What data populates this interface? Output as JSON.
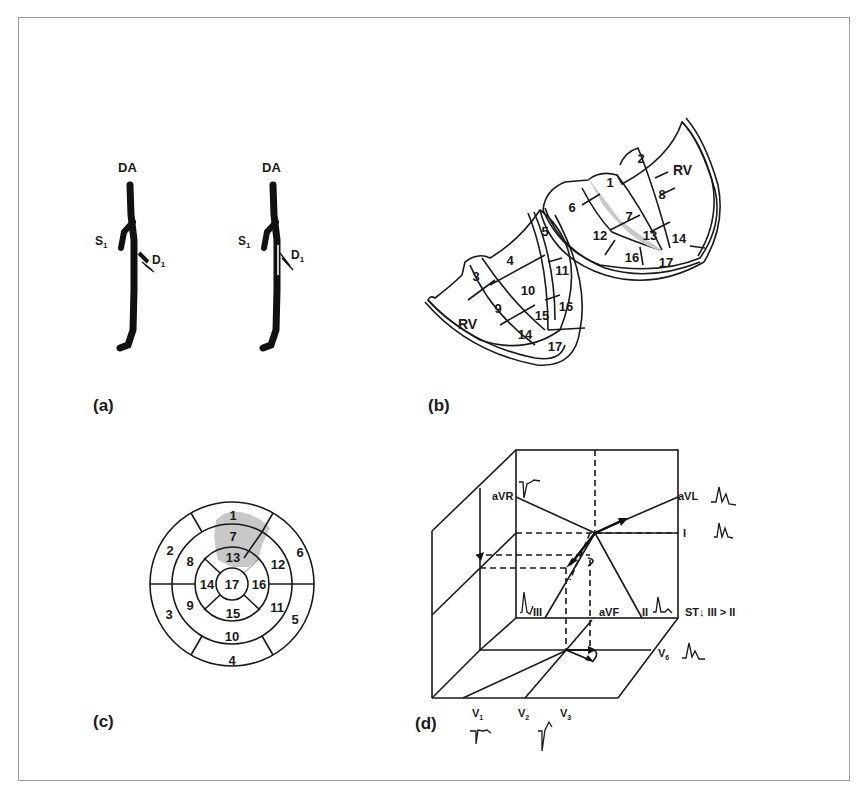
{
  "figure": {
    "panels": {
      "a": {
        "label": "(a)",
        "left_artery": {
          "top": "DA",
          "septal": "S",
          "septal_sub": "1",
          "diagonal": "D",
          "diagonal_sub": "1"
        },
        "right_artery": {
          "top": "DA",
          "septal": "S",
          "septal_sub": "1",
          "diagonal": "D",
          "diagonal_sub": "1"
        }
      },
      "b": {
        "label": "(b)",
        "upper_slice": {
          "rv": "RV",
          "segments": [
            "1",
            "2",
            "6",
            "7",
            "8",
            "12",
            "13",
            "14",
            "16",
            "17"
          ]
        },
        "lower_slice": {
          "rv": "RV",
          "segments": [
            "3",
            "4",
            "5",
            "9",
            "10",
            "11",
            "14",
            "15",
            "16",
            "17"
          ]
        },
        "highlighted_segments": [
          "1",
          "7",
          "13"
        ],
        "highlight_color": "#c8c8c8"
      },
      "c": {
        "label": "(c)",
        "outer_ring": [
          "1",
          "6",
          "5",
          "4",
          "3",
          "2"
        ],
        "middle_ring": [
          "7",
          "12",
          "11",
          "10",
          "9",
          "8"
        ],
        "inner_ring": [
          "13",
          "16",
          "15",
          "14"
        ],
        "apex": "17",
        "highlighted_segments": [
          "1",
          "7",
          "13"
        ],
        "highlight_color": "#c8c8c8"
      },
      "d": {
        "label": "(d)",
        "leads": {
          "aVR": "aVR",
          "aVL": "aVL",
          "I": "I",
          "III": "III",
          "aVF": "aVF",
          "II": "II",
          "V6": "V",
          "V6_sub": "6",
          "V1": "V",
          "V1_sub": "1",
          "V2": "V",
          "V2_sub": "2",
          "V3": "V",
          "V3_sub": "3"
        },
        "annotation": "ST↓  III > II"
      }
    },
    "colors": {
      "line": "#1a1a1a",
      "highlight": "#c8c8c8",
      "frame": "#9a9a9a"
    }
  }
}
